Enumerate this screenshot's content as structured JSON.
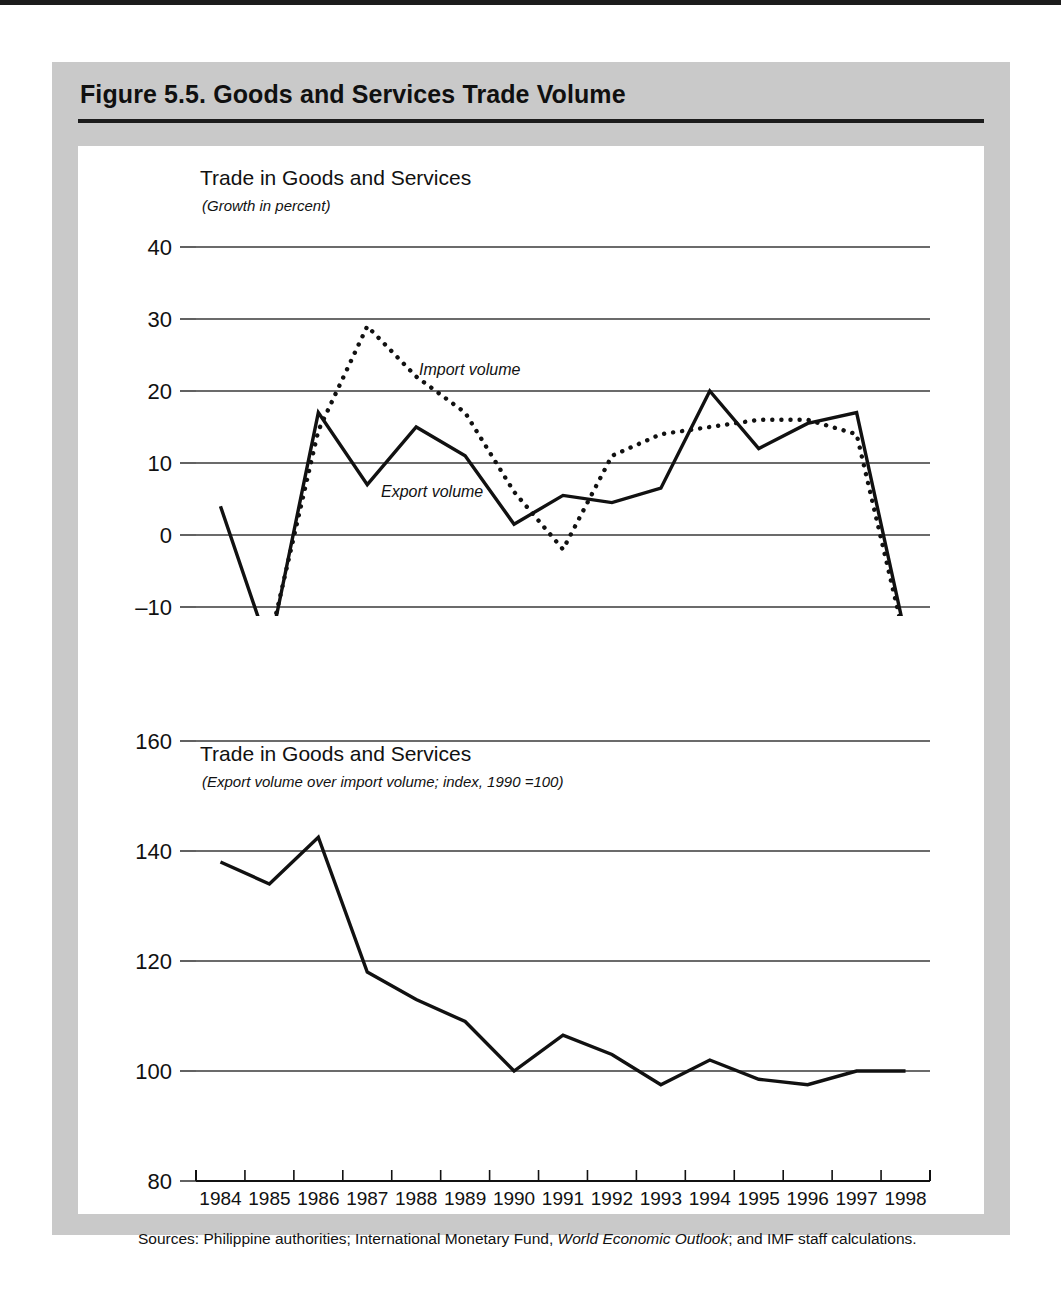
{
  "figure": {
    "title": "Figure 5.5.  Goods and Services Trade Volume",
    "source_prefix": "Sources:  Philippine authorities; International Monetary Fund, ",
    "source_italic": "World Economic Outlook",
    "source_suffix": "; and IMF staff calculations."
  },
  "chart_data": [
    {
      "type": "line",
      "panel": "top",
      "title": "Trade in Goods and Services",
      "subtitle": "(Growth in percent)",
      "xlabel": "",
      "ylabel": "",
      "grid": true,
      "legend_position": "inline-annotation",
      "x": [
        "1984",
        "1985",
        "1986",
        "1987",
        "1988",
        "1989",
        "1990",
        "1991",
        "1992",
        "1993",
        "1994",
        "1995",
        "1996",
        "1997",
        "1998"
      ],
      "ylim": [
        -20,
        40
      ],
      "yticks": [
        "40",
        "30",
        "20",
        "10",
        "0",
        "–10",
        "–20"
      ],
      "ytick_values": [
        40,
        30,
        20,
        10,
        0,
        -10,
        -20
      ],
      "series": [
        {
          "name": "Export volume",
          "style": "solid",
          "color": "#111111",
          "values": [
            4,
            -16,
            17,
            7,
            15,
            11,
            1.5,
            5.5,
            4.5,
            6.5,
            20,
            12,
            15.5,
            17,
            -14
          ]
        },
        {
          "name": "Import volume",
          "style": "dotted",
          "color": "#111111",
          "values": [
            -17,
            -15,
            14.5,
            29,
            22,
            17,
            6,
            -2,
            11,
            14,
            15,
            16,
            16,
            14,
            -15
          ]
        }
      ],
      "annotations": [
        {
          "text": "Import volume",
          "x": "1987",
          "y": 21
        },
        {
          "text": "Export volume",
          "x": "1988",
          "y": 5
        }
      ]
    },
    {
      "type": "line",
      "panel": "bottom",
      "title": "Trade in Goods and Services",
      "subtitle": "(Export volume over import volume; index, 1990 =100)",
      "xlabel": "",
      "ylabel": "",
      "grid": true,
      "legend_position": "none",
      "x": [
        "1984",
        "1985",
        "1986",
        "1987",
        "1988",
        "1989",
        "1990",
        "1991",
        "1992",
        "1993",
        "1994",
        "1995",
        "1996",
        "1997",
        "1998"
      ],
      "ylim": [
        80,
        160
      ],
      "yticks": [
        "160",
        "140",
        "120",
        "100",
        "80"
      ],
      "ytick_values": [
        160,
        140,
        120,
        100,
        80
      ],
      "series": [
        {
          "name": "Export volume over import volume index",
          "style": "solid",
          "color": "#111111",
          "values": [
            138,
            134,
            142.5,
            118,
            113,
            109,
            100,
            106.5,
            103,
            97.5,
            102,
            98.5,
            97.5,
            100,
            100
          ]
        }
      ],
      "annotations": []
    }
  ]
}
